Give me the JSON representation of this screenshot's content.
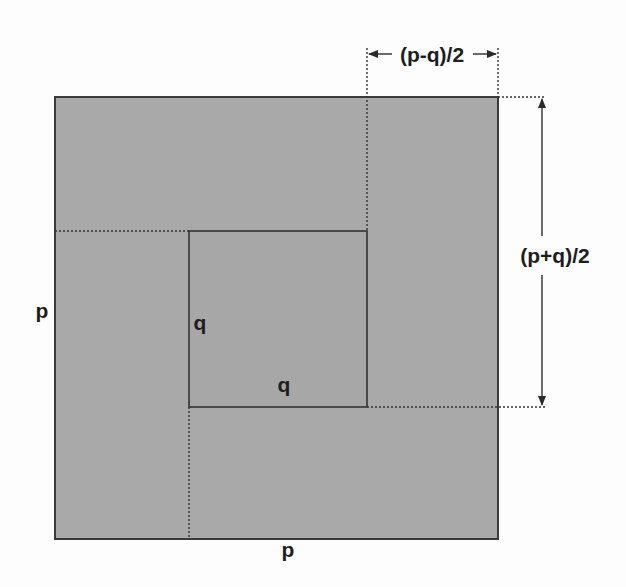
{
  "diagram": {
    "type": "nested-squares-geometric-proof",
    "colors": {
      "fill": "#a9a9a9",
      "stroke": "#3a3a3a",
      "background": "#fdfdfd",
      "text": "#1e1e1e"
    },
    "outer_square": {
      "side_label_left": "p",
      "side_label_bottom": "p"
    },
    "inner_square": {
      "side_label_left": "q",
      "side_label_bottom": "q"
    },
    "dimensions": {
      "top": "(p-q)/2",
      "right": "(p+q)/2"
    }
  }
}
